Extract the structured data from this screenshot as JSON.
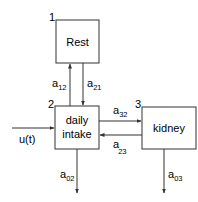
{
  "diagram": {
    "type": "compartment-model",
    "compartments": [
      {
        "id": 1,
        "number": "1",
        "label": "Rest"
      },
      {
        "id": 2,
        "number": "2",
        "label_line1": "daily",
        "label_line2": "intake"
      },
      {
        "id": 3,
        "number": "3",
        "label": "kidney"
      }
    ],
    "input": {
      "label": "u(t)",
      "target": 2
    },
    "flows": [
      {
        "from": 2,
        "to": 1,
        "symbol": "a",
        "subscript": "12"
      },
      {
        "from": 1,
        "to": 2,
        "symbol": "a",
        "subscript": "21"
      },
      {
        "from": 2,
        "to": 3,
        "symbol": "a",
        "subscript": "32"
      },
      {
        "from": 3,
        "to": 2,
        "symbol": "a",
        "subscript": "23"
      },
      {
        "from": 2,
        "to": "out",
        "symbol": "a",
        "subscript": "02"
      },
      {
        "from": 3,
        "to": "out",
        "symbol": "a",
        "subscript": "03"
      }
    ],
    "colors": {
      "stroke": "#333333",
      "text": "#1a1a1a",
      "background": "#ffffff"
    }
  }
}
